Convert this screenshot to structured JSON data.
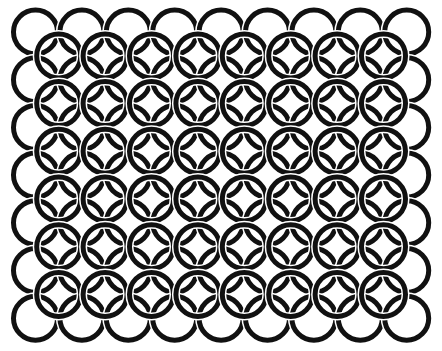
{
  "pattern": {
    "type": "interlocking-circles",
    "background": "#ffffff",
    "stroke_color": "#111111",
    "gap_color": "#ffffff",
    "stroke_width": 5,
    "radius": 22,
    "outer_grid": {
      "cols": 9,
      "rows": 7,
      "x0": 35.5,
      "y0": 32,
      "dx": 46.4,
      "dy": 47.7
    },
    "inner_grid": {
      "cols": 8,
      "rows": 6,
      "x0": 58.7,
      "y0": 55.9,
      "dx": 46.4,
      "dy": 47.7
    }
  }
}
